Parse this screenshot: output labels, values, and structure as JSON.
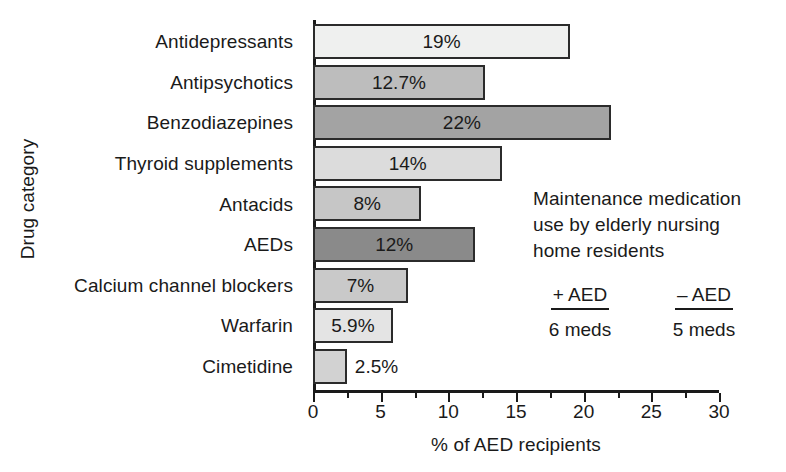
{
  "chart_data": {
    "type": "bar",
    "orientation": "horizontal",
    "title": "",
    "xlabel": "% of AED recipients",
    "ylabel": "Drug category",
    "xlim": [
      0,
      30
    ],
    "xticks": [
      0,
      5,
      10,
      15,
      20,
      25,
      30
    ],
    "xtick_labels": [
      "0",
      "5",
      "10",
      "15",
      "20",
      "25",
      "30"
    ],
    "minor_ticks": [
      2.5,
      7.5,
      12.5,
      17.5,
      22.5,
      27.5
    ],
    "grid": false,
    "legend": "none",
    "categories": [
      "Antidepressants",
      "Antipsychotics",
      "Benzodiazepines",
      "Thyroid supplements",
      "Antacids",
      "AEDs",
      "Calcium channel blockers",
      "Warfarin",
      "Cimetidine"
    ],
    "values": [
      19,
      12.7,
      22,
      14,
      8,
      12,
      7,
      5.9,
      2.5
    ],
    "value_labels": [
      "19%",
      "12.7%",
      "22%",
      "14%",
      "8%",
      "12%",
      "7%",
      "5.9%",
      "2.5%"
    ],
    "label_placement": [
      "inside",
      "inside",
      "inside",
      "inside",
      "inside",
      "inside",
      "inside",
      "inside",
      "outside"
    ],
    "bar_colors": [
      "#eff0ef",
      "#bdbdbd",
      "#a3a3a3",
      "#dcdcdc",
      "#c6c6c6",
      "#8a8a8a",
      "#c9c9c9",
      "#e4e4e4",
      "#d2d2d2"
    ],
    "bar_edge_color": "#2b2b2b",
    "axis_color": "#1a1a1a",
    "annotation": {
      "lines": [
        "Maintenance medication",
        "use by elderly nursing",
        "home residents"
      ],
      "columns": [
        {
          "header": "+ AED",
          "value": "6 meds"
        },
        {
          "header": "– AED",
          "value": "5 meds"
        }
      ]
    }
  }
}
